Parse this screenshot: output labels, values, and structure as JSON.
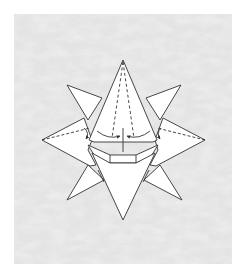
{
  "figure": {
    "background": {
      "color": "#e6e6e6",
      "texture": "marbled-grey",
      "panel": {
        "x": 14,
        "y": 14,
        "width": 218,
        "height": 250
      }
    },
    "colors": {
      "paper": "#ffffff",
      "line": "#333333",
      "panel_base": "#e4e4e4",
      "texture_light": "#f4f4f4",
      "texture_dark": "#d2d2d2"
    },
    "annotations": {
      "valley_folds": "dashed lines on the top, left and right points",
      "arrows": "two curved arrows pointing to the center line, plus side arrows on left and right flaps"
    }
  }
}
